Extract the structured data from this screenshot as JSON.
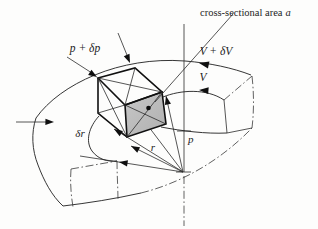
{
  "figure": {
    "labels": {
      "area_text": "cross-sectional area",
      "area_var": "a",
      "pressure_outer": "p + δp",
      "pressure_inner": "p",
      "velocity_outer": "V + δV",
      "velocity_inner": "V",
      "radial_thickness": "δr",
      "radius": "r"
    },
    "colors": {
      "background": "#fdfdfc",
      "line": "#2b2b2b",
      "heavy_line": "#101010",
      "shaded_face": "#bdbdbd"
    }
  }
}
